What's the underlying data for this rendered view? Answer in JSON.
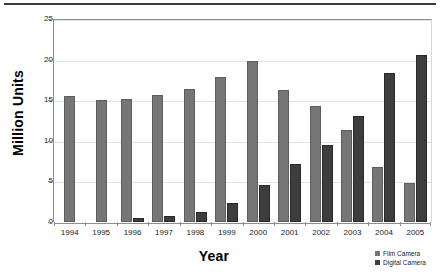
{
  "chart_data": {
    "type": "bar",
    "title": "",
    "subtitle": "",
    "xlabel": "Year",
    "ylabel": "Million Units",
    "categories": [
      "1994",
      "1995",
      "1996",
      "1997",
      "1998",
      "1999",
      "2000",
      "2001",
      "2002",
      "2003",
      "2004",
      "2005"
    ],
    "series": [
      {
        "name": "Film Camera",
        "color": "#767676",
        "values": [
          15.5,
          15.0,
          15.1,
          15.6,
          16.4,
          17.9,
          19.8,
          16.3,
          14.3,
          11.3,
          6.8,
          4.8
        ]
      },
      {
        "name": "Digital Camera",
        "color": "#3d3d3d",
        "values": [
          0,
          0,
          0.5,
          0.7,
          1.2,
          2.3,
          4.6,
          7.1,
          9.5,
          13.0,
          18.3,
          20.6
        ]
      }
    ],
    "ylim": [
      0,
      25
    ],
    "ytick_values": [
      0,
      5,
      10,
      15,
      20,
      25
    ],
    "ytick_labels": [
      "0",
      "5",
      "10",
      "15",
      "20",
      "25"
    ],
    "grid": true,
    "grid_axis": "y",
    "legend_position": "bottom-right",
    "legend": [
      "Film Camera",
      "Digital Camera"
    ]
  },
  "axes": {
    "y_title": "Million Units",
    "x_title": "Year"
  },
  "legend": {
    "items": [
      {
        "label": "Film Camera",
        "color": "#767676"
      },
      {
        "label": "Digital Camera",
        "color": "#3d3d3d"
      }
    ]
  },
  "colors": {
    "film": "#767676",
    "digital": "#3d3d3d",
    "grid": "#e2e2e2",
    "axis": "#8d8d8d",
    "rule": "#3b3b3b",
    "background": "#ffffff"
  }
}
